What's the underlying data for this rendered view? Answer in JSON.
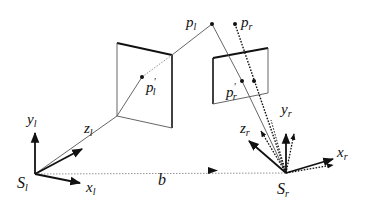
{
  "diagram": {
    "type": "stereo-camera-geometry",
    "left_camera": {
      "origin_label": "S",
      "origin_sub": "l",
      "axes": {
        "x": {
          "label": "x",
          "sub": "l"
        },
        "y": {
          "label": "y",
          "sub": "l"
        },
        "z": {
          "label": "z",
          "sub": "l"
        }
      },
      "image_point": {
        "label": "p",
        "sub": "l",
        "prime": "′"
      }
    },
    "right_camera": {
      "origin_label": "S",
      "origin_sub": "r",
      "axes": {
        "x": {
          "label": "x",
          "sub": "r"
        },
        "y": {
          "label": "y",
          "sub": "r"
        },
        "z": {
          "label": "z",
          "sub": "r"
        }
      },
      "image_point": {
        "label": "p",
        "sub": "r",
        "prime": "′"
      }
    },
    "world_points": [
      {
        "label": "p",
        "sub": "l"
      },
      {
        "label": "p",
        "sub": "r"
      }
    ],
    "baseline": {
      "label": "b"
    },
    "colors": {
      "stroke": "#111111",
      "thin_line": "#555555",
      "background": "#ffffff"
    }
  }
}
